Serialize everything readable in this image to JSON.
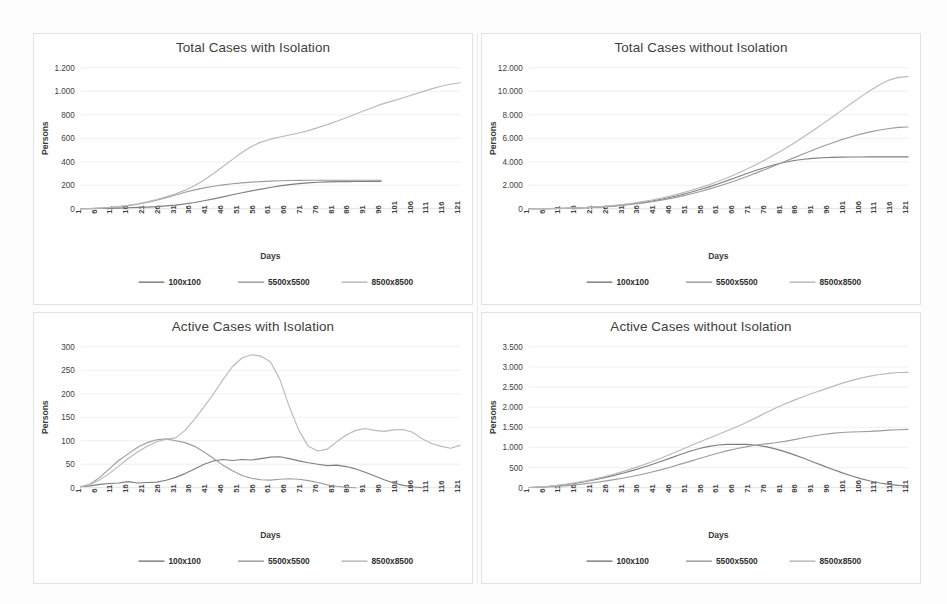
{
  "figure": {
    "width": 947,
    "height": 604,
    "background": "#ffffff",
    "panel_border_color": "#e2e2e2"
  },
  "series_style": {
    "100x100": {
      "color": "#7f7f7f",
      "label": "100x100"
    },
    "5500x5500": {
      "color": "#9d9d9d",
      "label": "5500x5500"
    },
    "8500x8500": {
      "color": "#b9b9b9",
      "label": "8500x8500"
    }
  },
  "common": {
    "xlabel": "Days",
    "ylabel": "Persons",
    "xticks": [
      1,
      6,
      11,
      16,
      21,
      26,
      31,
      36,
      41,
      46,
      51,
      56,
      61,
      66,
      71,
      76,
      81,
      86,
      91,
      96,
      101,
      106,
      111,
      116,
      121
    ],
    "xlim": [
      1,
      121
    ],
    "legend_position": "bottom",
    "legend_entries": [
      "100x100",
      "5500x5500",
      "8500x8500"
    ],
    "grid": true
  },
  "chart_data": [
    {
      "id": "total-cases-with-isolation",
      "type": "line",
      "title": "Total Cases with Isolation",
      "xlabel": "Days",
      "ylabel": "Persons",
      "xlim": [
        1,
        121
      ],
      "ylim": [
        0,
        1200
      ],
      "yticks": [
        0,
        200,
        400,
        600,
        800,
        1000,
        1200
      ],
      "ytick_labels": [
        "0",
        "200",
        "400",
        "600",
        "800",
        "1.000",
        "1.200"
      ],
      "xticks": [
        1,
        6,
        11,
        16,
        21,
        26,
        31,
        36,
        41,
        46,
        51,
        56,
        61,
        66,
        71,
        76,
        81,
        86,
        91,
        96,
        101,
        106,
        111,
        116,
        121
      ],
      "grid": true,
      "legend": [
        "100x100",
        "5500x5500",
        "8500x8500"
      ],
      "x": [
        1,
        4,
        7,
        10,
        13,
        16,
        19,
        22,
        25,
        28,
        31,
        34,
        37,
        40,
        43,
        46,
        49,
        52,
        55,
        58,
        61,
        64,
        67,
        70,
        73,
        76,
        79,
        82,
        85,
        88,
        91,
        94,
        96,
        100,
        103,
        106,
        109,
        112,
        115,
        118,
        121
      ],
      "series": [
        {
          "name": "100x100",
          "values": [
            0,
            1,
            2,
            3,
            5,
            8,
            11,
            14,
            18,
            24,
            31,
            41,
            53,
            68,
            84,
            101,
            119,
            136,
            152,
            167,
            181,
            194,
            205,
            213,
            220,
            225,
            228,
            230,
            231,
            232,
            232,
            233,
            233,
            null,
            null,
            null,
            null,
            null,
            null,
            null,
            null
          ]
        },
        {
          "name": "5500x5500",
          "values": [
            0,
            2,
            5,
            9,
            16,
            26,
            38,
            53,
            72,
            94,
            117,
            140,
            160,
            177,
            191,
            203,
            212,
            220,
            226,
            231,
            235,
            238,
            240,
            241,
            242,
            242,
            242,
            242,
            242,
            242,
            242,
            242,
            242,
            null,
            null,
            null,
            null,
            null,
            null,
            null,
            null
          ]
        },
        {
          "name": "8500x8500",
          "values": [
            0,
            2,
            5,
            10,
            18,
            28,
            42,
            58,
            78,
            101,
            127,
            158,
            196,
            244,
            300,
            360,
            420,
            478,
            530,
            567,
            592,
            610,
            627,
            645,
            665,
            690,
            716,
            745,
            775,
            806,
            838,
            868,
            888,
            920,
            945,
            970,
            995,
            1020,
            1042,
            1060,
            1072
          ]
        }
      ]
    },
    {
      "id": "total-cases-without-isolation",
      "type": "line",
      "title": "Total Cases without Isolation",
      "xlabel": "Days",
      "ylabel": "Persons",
      "xlim": [
        1,
        121
      ],
      "ylim": [
        0,
        12000
      ],
      "yticks": [
        0,
        2000,
        4000,
        6000,
        8000,
        10000,
        12000
      ],
      "ytick_labels": [
        "0",
        "2.000",
        "4.000",
        "6.000",
        "8.000",
        "10.000",
        "12.000"
      ],
      "xticks": [
        1,
        6,
        11,
        16,
        21,
        26,
        31,
        36,
        41,
        46,
        51,
        56,
        61,
        66,
        71,
        76,
        81,
        86,
        91,
        96,
        101,
        106,
        111,
        116,
        121
      ],
      "grid": true,
      "legend": [
        "100x100",
        "5500x5500",
        "8500x8500"
      ],
      "x": [
        1,
        4,
        7,
        10,
        13,
        16,
        19,
        22,
        25,
        28,
        31,
        34,
        37,
        40,
        43,
        46,
        49,
        52,
        55,
        58,
        61,
        64,
        67,
        70,
        73,
        76,
        79,
        82,
        85,
        88,
        91,
        94,
        97,
        100,
        103,
        106,
        109,
        112,
        115,
        118,
        121
      ],
      "series": [
        {
          "name": "100x100",
          "values": [
            0,
            5,
            12,
            22,
            38,
            60,
            90,
            130,
            180,
            245,
            325,
            420,
            530,
            660,
            810,
            980,
            1170,
            1380,
            1610,
            1860,
            2130,
            2410,
            2700,
            2990,
            3270,
            3530,
            3760,
            3950,
            4100,
            4210,
            4290,
            4340,
            4370,
            4390,
            4400,
            4405,
            4408,
            4410,
            4410,
            4410,
            4410
          ]
        },
        {
          "name": "5500x5500",
          "values": [
            0,
            4,
            10,
            20,
            34,
            54,
            82,
            118,
            164,
            222,
            292,
            378,
            478,
            595,
            728,
            880,
            1048,
            1235,
            1440,
            1665,
            1910,
            2172,
            2450,
            2745,
            3050,
            3365,
            3690,
            4020,
            4350,
            4680,
            5000,
            5310,
            5600,
            5880,
            6130,
            6350,
            6540,
            6700,
            6830,
            6920,
            6960
          ]
        },
        {
          "name": "8500x8500",
          "values": [
            0,
            6,
            14,
            26,
            44,
            70,
            104,
            150,
            206,
            278,
            366,
            472,
            598,
            744,
            910,
            1096,
            1302,
            1528,
            1776,
            2046,
            2340,
            2660,
            3005,
            3375,
            3770,
            4190,
            4635,
            5105,
            5600,
            6120,
            6660,
            7220,
            7790,
            8370,
            8950,
            9520,
            10070,
            10560,
            10950,
            11180,
            11250
          ]
        }
      ]
    },
    {
      "id": "active-cases-with-isolation",
      "type": "line",
      "title": "Active Cases with Isolation",
      "xlabel": "Days",
      "ylabel": "Persons",
      "xlim": [
        1,
        121
      ],
      "ylim": [
        0,
        300
      ],
      "yticks": [
        0,
        50,
        100,
        150,
        200,
        250,
        300
      ],
      "ytick_labels": [
        "0",
        "50",
        "100",
        "150",
        "200",
        "250",
        "300"
      ],
      "xticks": [
        1,
        6,
        11,
        16,
        21,
        26,
        31,
        36,
        41,
        46,
        51,
        56,
        61,
        66,
        71,
        76,
        81,
        86,
        91,
        96,
        101,
        106,
        111,
        116,
        121
      ],
      "grid": true,
      "legend": [
        "100x100",
        "5500x5500",
        "8500x8500"
      ],
      "x": [
        1,
        4,
        7,
        10,
        13,
        16,
        19,
        22,
        25,
        28,
        31,
        34,
        37,
        40,
        43,
        46,
        49,
        52,
        55,
        58,
        61,
        64,
        67,
        70,
        73,
        76,
        79,
        82,
        85,
        88,
        91,
        94,
        97,
        100,
        103,
        106,
        109,
        112,
        115,
        118,
        121
      ],
      "series": [
        {
          "name": "100x100",
          "values": [
            2,
            4,
            7,
            9,
            10,
            13,
            10,
            11,
            12,
            16,
            22,
            30,
            40,
            50,
            57,
            60,
            58,
            60,
            59,
            62,
            65,
            66,
            62,
            57,
            53,
            50,
            47,
            48,
            45,
            40,
            33,
            25,
            17,
            10,
            5,
            2,
            0,
            null,
            null,
            null,
            null
          ]
        },
        {
          "name": "5500x5500",
          "values": [
            2,
            8,
            22,
            40,
            58,
            72,
            86,
            96,
            102,
            104,
            100,
            96,
            88,
            76,
            62,
            48,
            36,
            26,
            20,
            17,
            16,
            18,
            19,
            18,
            15,
            11,
            6,
            3,
            1,
            0,
            null,
            null,
            null,
            null,
            null,
            null,
            null,
            null,
            null,
            null,
            null
          ]
        },
        {
          "name": "8500x8500",
          "values": [
            2,
            7,
            17,
            30,
            46,
            62,
            76,
            88,
            98,
            103,
            106,
            122,
            146,
            172,
            200,
            230,
            258,
            276,
            283,
            280,
            268,
            230,
            172,
            122,
            88,
            78,
            82,
            98,
            112,
            122,
            126,
            122,
            120,
            123,
            124,
            118,
            104,
            94,
            88,
            84,
            90
          ]
        }
      ]
    },
    {
      "id": "active-cases-without-isolation",
      "type": "line",
      "title": "Active Cases without Isolation",
      "xlabel": "Days",
      "ylabel": "Persons",
      "xlim": [
        1,
        121
      ],
      "ylim": [
        0,
        3500
      ],
      "yticks": [
        0,
        500,
        1000,
        1500,
        2000,
        2500,
        3000,
        3500
      ],
      "ytick_labels": [
        "0",
        "500",
        "1.000",
        "1.500",
        "2.000",
        "2.500",
        "3.000",
        "3.500"
      ],
      "xticks": [
        1,
        6,
        11,
        16,
        21,
        26,
        31,
        36,
        41,
        46,
        51,
        56,
        61,
        66,
        71,
        76,
        81,
        86,
        91,
        96,
        101,
        106,
        111,
        116,
        121
      ],
      "grid": true,
      "legend": [
        "100x100",
        "5500x5500",
        "8500x8500"
      ],
      "x": [
        1,
        4,
        7,
        10,
        13,
        16,
        19,
        22,
        25,
        28,
        31,
        34,
        37,
        40,
        43,
        46,
        49,
        52,
        55,
        58,
        61,
        64,
        67,
        70,
        73,
        76,
        79,
        82,
        85,
        88,
        91,
        94,
        97,
        100,
        103,
        106,
        109,
        112,
        115,
        118,
        121
      ],
      "series": [
        {
          "name": "100x100",
          "values": [
            5,
            15,
            30,
            52,
            80,
            115,
            155,
            200,
            250,
            305,
            365,
            430,
            500,
            575,
            655,
            740,
            825,
            905,
            975,
            1025,
            1060,
            1075,
            1080,
            1075,
            1055,
            1020,
            965,
            895,
            815,
            730,
            640,
            548,
            460,
            375,
            295,
            225,
            165,
            118,
            82,
            58,
            45
          ]
        },
        {
          "name": "5500x5500",
          "values": [
            4,
            10,
            20,
            34,
            52,
            74,
            100,
            130,
            164,
            200,
            240,
            285,
            335,
            390,
            450,
            515,
            585,
            655,
            725,
            795,
            860,
            920,
            975,
            1020,
            1060,
            1090,
            1115,
            1150,
            1195,
            1240,
            1285,
            1320,
            1350,
            1370,
            1382,
            1390,
            1398,
            1412,
            1428,
            1440,
            1450
          ]
        },
        {
          "name": "8500x8500",
          "values": [
            6,
            16,
            34,
            58,
            88,
            126,
            170,
            220,
            276,
            338,
            406,
            480,
            560,
            646,
            738,
            836,
            938,
            1038,
            1135,
            1230,
            1325,
            1420,
            1520,
            1625,
            1740,
            1860,
            1975,
            2080,
            2175,
            2265,
            2350,
            2430,
            2510,
            2590,
            2660,
            2720,
            2770,
            2810,
            2840,
            2860,
            2865
          ]
        }
      ]
    }
  ]
}
